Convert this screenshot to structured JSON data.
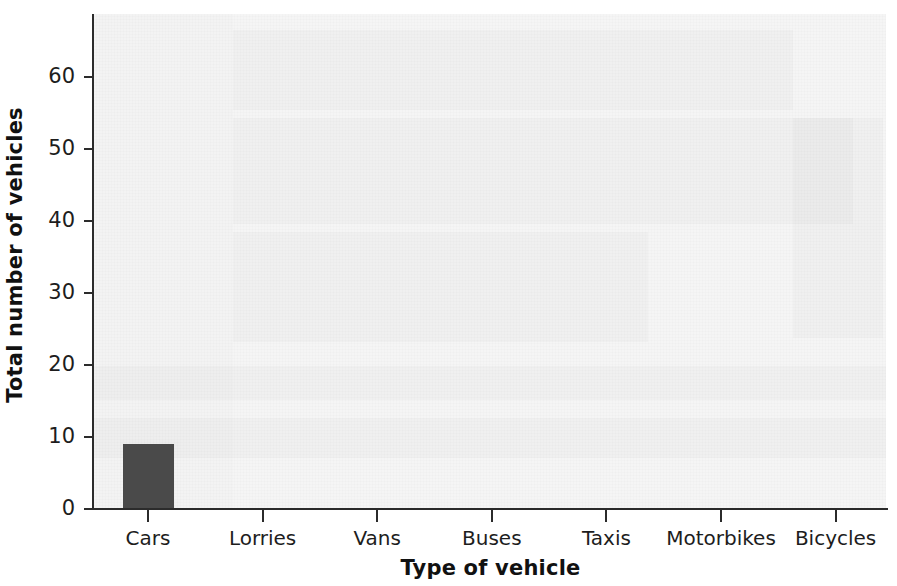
{
  "chart_data": {
    "type": "bar",
    "title": "",
    "xlabel": "Type of vehicle",
    "ylabel": "Total number of vehicles",
    "categories": [
      "Cars",
      "Lorries",
      "Vans",
      "Buses",
      "Taxis",
      "Motorbikes",
      "Bicycles"
    ],
    "values": [
      9,
      0,
      0,
      0,
      0,
      0,
      0
    ],
    "ylim": [
      0,
      68
    ],
    "ytick_labels": [
      "0",
      "10",
      "20",
      "30",
      "40",
      "50",
      "60"
    ],
    "ytick_values": [
      0,
      10,
      20,
      30,
      40,
      50,
      60
    ],
    "grid": false,
    "legend": null,
    "bar_color": "#4a4a4a",
    "plot_background": "#f5f5f5",
    "axis_color": "#2b2b2b"
  },
  "axes": {
    "y_title": "Total number of vehicles",
    "x_title": "Type of vehicle"
  }
}
